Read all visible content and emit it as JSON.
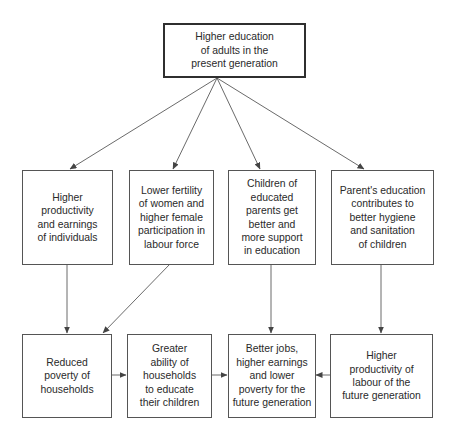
{
  "diagram": {
    "type": "flowchart",
    "top_node": {
      "id": "higher-education-adults",
      "label": "Higher education\nof adults in the\npresent generation"
    },
    "middle_nodes": [
      {
        "id": "higher-productivity-individuals",
        "label": "Higher\nproductivity\nand earnings\nof individuals"
      },
      {
        "id": "lower-fertility-women",
        "label": "Lower fertility\nof women and\nhigher female\nparticipation in\nlabour force"
      },
      {
        "id": "children-educated-parents",
        "label": "Children of\neducated\nparents get\nbetter and\nmore support\nin education"
      },
      {
        "id": "parents-education-hygiene",
        "label": "Parent's education\ncontributes to\nbetter hygiene\nand sanitation\nof children"
      }
    ],
    "bottom_nodes": [
      {
        "id": "reduced-poverty-households",
        "label": "Reduced\npoverty of\nhouseholds"
      },
      {
        "id": "greater-ability-households",
        "label": "Greater\nability of\nhouseholds\nto educate\ntheir children"
      },
      {
        "id": "better-jobs-future",
        "label": "Better jobs,\nhigher earnings\nand lower\npoverty for the\nfuture generation"
      },
      {
        "id": "higher-productivity-future",
        "label": "Higher\nproductivity of\nlabour of the\nfuture generation"
      }
    ],
    "edges": [
      {
        "from": "higher-education-adults",
        "to": "higher-productivity-individuals"
      },
      {
        "from": "higher-education-adults",
        "to": "lower-fertility-women"
      },
      {
        "from": "higher-education-adults",
        "to": "children-educated-parents"
      },
      {
        "from": "higher-education-adults",
        "to": "parents-education-hygiene"
      },
      {
        "from": "higher-productivity-individuals",
        "to": "reduced-poverty-households"
      },
      {
        "from": "lower-fertility-women",
        "to": "reduced-poverty-households"
      },
      {
        "from": "children-educated-parents",
        "to": "better-jobs-future"
      },
      {
        "from": "parents-education-hygiene",
        "to": "higher-productivity-future"
      },
      {
        "from": "reduced-poverty-households",
        "to": "greater-ability-households"
      },
      {
        "from": "greater-ability-households",
        "to": "better-jobs-future"
      },
      {
        "from": "higher-productivity-future",
        "to": "better-jobs-future"
      }
    ]
  },
  "colors": {
    "line": "#444444",
    "border": "#555555",
    "text": "#2a2a2a",
    "background": "#ffffff"
  }
}
